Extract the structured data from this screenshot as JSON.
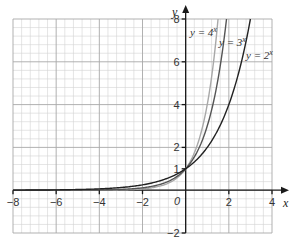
{
  "chart_data": {
    "type": "line",
    "title": "",
    "xlabel": "x",
    "ylabel": "y",
    "xlim": [
      -8,
      4
    ],
    "ylim": [
      -2,
      8
    ],
    "grid": true,
    "grid_minor_step": 0.4,
    "grid_major_step": 2,
    "x_ticks": [
      -8,
      -6,
      -4,
      -2,
      0,
      2,
      4
    ],
    "x_tick_labels": [
      "-8",
      "-6",
      "-4",
      "-2",
      "0",
      "2",
      "4"
    ],
    "y_ticks": [
      -2,
      1,
      2,
      4,
      6,
      8
    ],
    "y_tick_labels": [
      "-2",
      "1",
      "2",
      "4",
      "6",
      "8"
    ],
    "series": [
      {
        "name": "y = 4^x",
        "label_base": "y = 4",
        "label_exp": "x",
        "base": 4,
        "color": "#a8a8a8",
        "x": [
          -8,
          -4,
          -2,
          -1,
          0,
          0.5,
          1,
          1.5
        ],
        "values": [
          1.53e-05,
          0.0039,
          0.0625,
          0.25,
          1,
          2,
          4,
          8
        ]
      },
      {
        "name": "y = 3^x",
        "label_base": "y = 3",
        "label_exp": "x",
        "base": 3,
        "color": "#555555",
        "x": [
          -8,
          -4,
          -2,
          -1,
          0,
          0.5,
          1,
          1.5,
          1.89
        ],
        "values": [
          0.00015,
          0.0123,
          0.111,
          0.333,
          1,
          1.73,
          3,
          5.2,
          8
        ]
      },
      {
        "name": "y = 2^x",
        "label_base": "y = 2",
        "label_exp": "x",
        "base": 2,
        "color": "#222222",
        "x": [
          -8,
          -4,
          -2,
          -1,
          0,
          1,
          2,
          3
        ],
        "values": [
          0.0039,
          0.0625,
          0.25,
          0.5,
          1,
          2,
          4,
          8
        ]
      }
    ],
    "annotations": [
      "y = 4^x",
      "y = 3^x",
      "y = 2^x"
    ],
    "legend_position": "inline labels near top-right of curves"
  },
  "axes": {
    "x_label": "x",
    "y_label": "y",
    "origin_label": "0"
  },
  "labels": {
    "y4": {
      "base": "y = 4",
      "exp": "x"
    },
    "y3": {
      "base": "y = 3",
      "exp": "x"
    },
    "y2": {
      "base": "y = 2",
      "exp": "x"
    }
  }
}
